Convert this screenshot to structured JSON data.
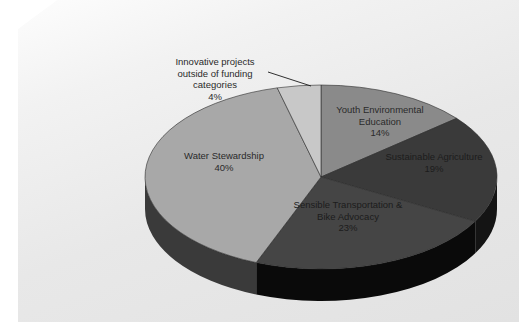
{
  "chart_data": {
    "type": "pie",
    "title": "",
    "subtitle": "",
    "xlabel": "",
    "ylabel": "",
    "legend_position": "none",
    "grid": false,
    "three_d": true,
    "units": "percent",
    "total": 100,
    "categories": [
      "Youth Environmental Education",
      "Sustainable Agriculture",
      "Sensible Transportation & Bike Advocacy",
      "Water Stewardship",
      "Innovative projects outside of funding categories"
    ],
    "values": [
      14,
      19,
      23,
      40,
      4
    ],
    "slices": [
      {
        "name": "Youth Environmental Education",
        "label_lines": [
          "Youth Environmental",
          "Education"
        ],
        "value": 14,
        "value_label": "14%",
        "color": "#8a8a8a",
        "side_color": "#5e5e5e",
        "label_x": 380,
        "label_y": 110,
        "label_on_dark": false,
        "leader": false
      },
      {
        "name": "Sustainable Agriculture",
        "label_lines": [
          "Sustainable Agriculture"
        ],
        "value": 19,
        "value_label": "19%",
        "color": "#3a3a3a",
        "side_color": "#141414",
        "label_x": 434,
        "label_y": 157,
        "label_on_dark": true,
        "leader": false
      },
      {
        "name": "Sensible Transportation & Bike Advocacy",
        "label_lines": [
          "Sensible Transportation &",
          "Bike Advocacy"
        ],
        "value": 23,
        "value_label": "23%",
        "color": "#454545",
        "side_color": "#0a0a0a",
        "label_x": 348,
        "label_y": 205,
        "label_on_dark": true,
        "leader": false
      },
      {
        "name": "Water Stewardship",
        "label_lines": [
          "Water Stewardship"
        ],
        "value": 40,
        "value_label": "40%",
        "color": "#a8a8a8",
        "side_color": "#3a3a3a",
        "label_x": 224,
        "label_y": 156,
        "label_on_dark": false,
        "leader": false
      },
      {
        "name": "Innovative projects outside of funding categories",
        "label_lines": [
          "Innovative projects",
          "outside of funding",
          "categories"
        ],
        "value": 4,
        "value_label": "4%",
        "color": "#c8c8c8",
        "side_color": "#8f8f8f",
        "label_x": 215,
        "label_y": 62,
        "label_on_dark": false,
        "leader": true,
        "leader_from_x": 268,
        "leader_from_y": 72,
        "leader_to_x": 311,
        "leader_to_y": 86
      }
    ],
    "geometry": {
      "center_x": 321,
      "center_y": 177,
      "radius_x": 176,
      "radius_y": 92,
      "depth": 32,
      "start_angle_deg": -90,
      "direction": "clockwise"
    },
    "colors": {
      "background_light": "#fdfdfd",
      "background_dark": "#e2e2e2",
      "page_margin": "#ffffff",
      "label_text": "#2a2a2a"
    }
  }
}
